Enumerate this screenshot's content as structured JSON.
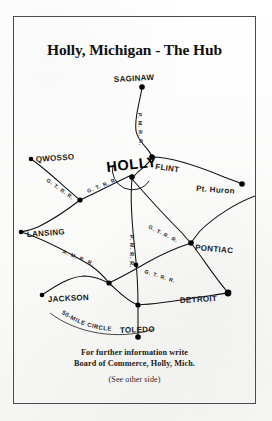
{
  "card": {
    "title": "Holly, Michigan - The Hub",
    "background_color": "#fdfdfc",
    "ink_color": "#111111",
    "border_color": "#4a4a4a"
  },
  "map": {
    "hub": {
      "name": "HOLLY",
      "label": "HOLLY",
      "x": 118,
      "y": 107
    },
    "cities": [
      {
        "id": "saginaw",
        "label": "SAGINAW",
        "x": 128,
        "y": 22,
        "label_x": 100,
        "label_y": 17,
        "anchor": "start"
      },
      {
        "id": "flint",
        "label": "FLINT",
        "x": 138,
        "y": 92,
        "label_x": 141,
        "label_y": 101,
        "anchor": "start"
      },
      {
        "id": "pt-huron",
        "label": "Pt. Huron",
        "x": 228,
        "y": 119,
        "label_x": 185,
        "label_y": 124,
        "anchor": "start"
      },
      {
        "id": "owosso",
        "label": "QWOSSO",
        "x": 17,
        "y": 94,
        "label_x": 22,
        "label_y": 97,
        "anchor": "start"
      },
      {
        "id": "lansing",
        "label": "LANSING",
        "x": 7,
        "y": 167,
        "label_x": 13,
        "label_y": 172,
        "anchor": "start"
      },
      {
        "id": "pontiac",
        "label": "PONTIAC",
        "x": 177,
        "y": 178,
        "label_x": 181,
        "label_y": 184,
        "anchor": "start"
      },
      {
        "id": "jackson",
        "label": "JACKSON",
        "x": 28,
        "y": 230,
        "label_x": 34,
        "label_y": 236,
        "anchor": "start"
      },
      {
        "id": "detroit",
        "label": "DETROIT",
        "x": 214,
        "y": 228,
        "label_x": 165,
        "label_y": 236,
        "anchor": "start"
      },
      {
        "id": "toledo",
        "label": "TOLEDO",
        "x": 124,
        "y": 272,
        "label_x": 110,
        "label_y": 266,
        "anchor": "start"
      }
    ],
    "junctions": [
      {
        "id": "j-owosso-lansing",
        "x": 66,
        "y": 135
      },
      {
        "id": "j-mid-south",
        "x": 95,
        "y": 218
      },
      {
        "id": "j-toledo-north",
        "x": 124,
        "y": 240
      },
      {
        "id": "j-gtrr-south",
        "x": 124,
        "y": 203
      }
    ],
    "railroad_labels": [
      {
        "id": "pm-saginaw-flint",
        "text": "P. M. R. R.",
        "x": 124,
        "y": 48,
        "rotate": 88
      },
      {
        "id": "gt-owosso",
        "text": "G. T. R. R.",
        "x": 33,
        "y": 113,
        "rotate": 36
      },
      {
        "id": "gt-holly-west",
        "text": "G. T. R. R.",
        "x": 76,
        "y": 122,
        "rotate": -21
      },
      {
        "id": "gt-holly-pontiac",
        "text": "G. T. R. R.",
        "x": 137,
        "y": 167,
        "rotate": 22
      },
      {
        "id": "am-lansing",
        "text": "A. M. R. R.",
        "x": 52,
        "y": 190,
        "rotate": 22
      },
      {
        "id": "pm-holly-south",
        "text": "P. M. R. R.",
        "x": 118,
        "y": 180,
        "rotate": 90
      },
      {
        "id": "gt-south-detroit",
        "text": "G. T. R. R.",
        "x": 130,
        "y": 200,
        "rotate": 20
      }
    ],
    "annotation": {
      "text": "50-MILE CIRCLE",
      "id": "fifty-mile-circle"
    }
  },
  "footer": {
    "line1": "For further information write",
    "line2": "Board of Commerce, Holly, Mich.",
    "note": "(See other side)"
  }
}
